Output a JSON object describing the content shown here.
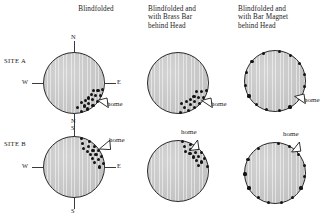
{
  "figure": {
    "type": "circular-orientation-diagram",
    "row_labels": [
      "SITE A",
      "SITE B"
    ],
    "column_headers": [
      "Blindfolded",
      "Blindfolded and\nwith Brass Bar\nbehind Head",
      "Blindfolded and\nwith Bar Magnet\nbehind Head"
    ],
    "compass_labels": {
      "north": "N",
      "south": "S",
      "east": "E",
      "west": "W"
    },
    "home_label": "home",
    "colors": {
      "disc_fill": "#c6c6c6",
      "disc_stroke": "#2a2a2a",
      "dot": "#141414",
      "text": "#1a1a1a"
    }
  },
  "chart_data": {
    "type": "scatter",
    "xlabel": "",
    "ylabel": "",
    "plot_kind": "circular vanishing-bearing diagram",
    "angle_convention": "degrees clockwise from North (0 = N, 90 = E, 180 = S, 270 = W)",
    "panels": [
      {
        "site": "SITE A",
        "condition": "Blindfolded",
        "row": 0,
        "col": 0,
        "compass_shown": true,
        "home_bearing": 118,
        "n": 17,
        "bearings": [
          102,
          108,
          112,
          116,
          120,
          124,
          128,
          132,
          136,
          140,
          144,
          148,
          152,
          156,
          160,
          166,
          172
        ],
        "interpretation": "tightly clustered toward home (ESE-SE)"
      },
      {
        "site": "SITE A",
        "condition": "Blindfolded and with Brass Bar behind Head",
        "row": 0,
        "col": 1,
        "compass_shown": false,
        "home_bearing": 118,
        "n": 16,
        "bearings": [
          104,
          110,
          115,
          120,
          125,
          130,
          134,
          138,
          142,
          146,
          150,
          155,
          160,
          165,
          170,
          176
        ],
        "interpretation": "tightly clustered toward home (ESE-SE)"
      },
      {
        "site": "SITE A",
        "condition": "Blindfolded and with Bar Magnet behind Head",
        "row": 0,
        "col": 2,
        "compass_shown": false,
        "home_bearing": 118,
        "n": 15,
        "bearings": [
          8,
          32,
          55,
          78,
          100,
          126,
          150,
          172,
          196,
          218,
          240,
          262,
          286,
          310,
          338
        ],
        "interpretation": "randomly scattered around the circle"
      },
      {
        "site": "SITE B",
        "condition": "Blindfolded",
        "row": 1,
        "col": 0,
        "compass_shown": true,
        "home_bearing": 46,
        "n": 17,
        "bearings": [
          14,
          20,
          26,
          31,
          36,
          41,
          45,
          49,
          53,
          57,
          61,
          65,
          69,
          73,
          78,
          84,
          90
        ],
        "interpretation": "tightly clustered toward home (NNE-ENE)"
      },
      {
        "site": "SITE B",
        "condition": "Blindfolded and with Brass Bar behind Head",
        "row": 1,
        "col": 1,
        "compass_shown": false,
        "home_bearing": 40,
        "n": 16,
        "bearings": [
          8,
          14,
          20,
          25,
          30,
          35,
          40,
          44,
          48,
          52,
          56,
          60,
          64,
          69,
          75,
          82
        ],
        "interpretation": "tightly clustered toward home (NNE)"
      },
      {
        "site": "SITE B",
        "condition": "Blindfolded and with Bar Magnet behind Head",
        "row": 1,
        "col": 2,
        "compass_shown": false,
        "home_bearing": 46,
        "n": 14,
        "bearings": [
          6,
          28,
          52,
          76,
          96,
          120,
          144,
          168,
          192,
          214,
          240,
          268,
          296,
          326
        ],
        "interpretation": "randomly scattered around the circle"
      }
    ]
  }
}
